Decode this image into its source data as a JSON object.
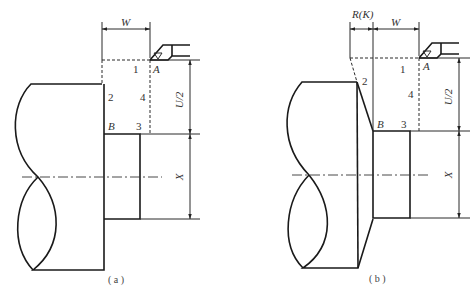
{
  "figure": {
    "panel_a": {
      "caption": "( a )",
      "dimensions": {
        "width": "W",
        "half_depth": "U/2",
        "diameter": "X"
      },
      "points": {
        "start": "A",
        "end": "B"
      },
      "path_steps": [
        "1",
        "2",
        "3",
        "4"
      ]
    },
    "panel_b": {
      "caption": "( b )",
      "dimensions": {
        "taper": "R(K)",
        "width": "W",
        "half_depth": "U/2",
        "diameter": "X"
      },
      "points": {
        "start": "A",
        "end": "B"
      },
      "path_steps": [
        "1",
        "2",
        "3",
        "4"
      ]
    },
    "colors": {
      "line": "#1a1a1a",
      "background": "#ffffff"
    }
  }
}
